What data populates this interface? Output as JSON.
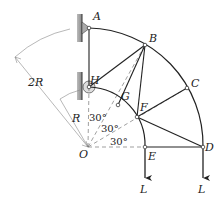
{
  "figure": {
    "type": "truss-diagram",
    "nodes": {
      "A": {
        "label": "A"
      },
      "B": {
        "label": "B"
      },
      "C": {
        "label": "C"
      },
      "D": {
        "label": "D"
      },
      "E": {
        "label": "E"
      },
      "F": {
        "label": "F"
      },
      "G": {
        "label": "G"
      },
      "H": {
        "label": "H"
      },
      "O": {
        "label": "O"
      }
    },
    "dimensions": {
      "outer_radius": "2R",
      "inner_radius": "R"
    },
    "angles": [
      "30°",
      "30°",
      "30°"
    ],
    "loads": [
      {
        "at": "E",
        "label": "L"
      },
      {
        "at": "D",
        "label": "L"
      }
    ],
    "members": [
      "A-B",
      "B-C",
      "C-D",
      "H-G",
      "G-F",
      "F-E",
      "A-H",
      "H-B",
      "G-B",
      "F-B",
      "F-C",
      "F-D",
      "E-D"
    ]
  }
}
